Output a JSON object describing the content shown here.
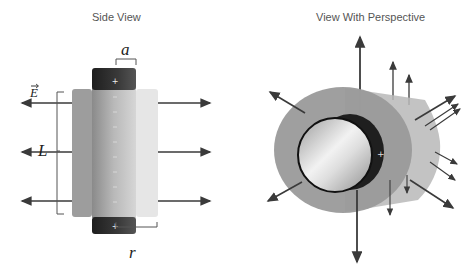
{
  "side_view": {
    "title": "Side View",
    "labels": {
      "field": "E",
      "length": "L",
      "inner_radius": "a",
      "outer_radius": "r"
    },
    "charge_sign": "+"
  },
  "perspective_view": {
    "title": "View With Perspective",
    "charge_sign": "+"
  },
  "colors": {
    "arrow": "#3a3a3a",
    "rod_cap": "#2a2a2a",
    "outer_shell": "#9a9a9a",
    "rod_body": "#b5b5b5"
  }
}
